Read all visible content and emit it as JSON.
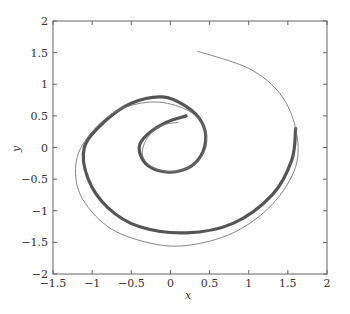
{
  "chart_data": {
    "type": "line",
    "title": "",
    "xlabel": "x",
    "ylabel": "y",
    "xlim": [
      -1.5,
      2
    ],
    "ylim": [
      -2,
      2
    ],
    "xticks": [
      "-1.5",
      "-1",
      "-0.5",
      "0",
      "0.5",
      "1",
      "1.5",
      "2"
    ],
    "yticks": [
      "2",
      "1.5",
      "1",
      "0.5",
      "0",
      "-0.5",
      "-1",
      "-1.5",
      "-2"
    ],
    "grid": false,
    "legend": null,
    "series": [
      {
        "name": "thick-spiral",
        "style": "thick dark gray markers",
        "color": "#555555",
        "points": [
          [
            0.2,
            0.5
          ],
          [
            -0.05,
            0.4
          ],
          [
            -0.3,
            0.2
          ],
          [
            -0.4,
            0
          ],
          [
            -0.32,
            -0.25
          ],
          [
            -0.1,
            -0.38
          ],
          [
            0.15,
            -0.36
          ],
          [
            0.35,
            -0.2
          ],
          [
            0.45,
            0.1
          ],
          [
            0.4,
            0.4
          ],
          [
            0.2,
            0.65
          ],
          [
            -0.1,
            0.8
          ],
          [
            -0.5,
            0.7
          ],
          [
            -0.85,
            0.4
          ],
          [
            -1.1,
            0
          ],
          [
            -1.05,
            -0.5
          ],
          [
            -0.8,
            -0.95
          ],
          [
            -0.4,
            -1.25
          ],
          [
            0.2,
            -1.35
          ],
          [
            0.8,
            -1.2
          ],
          [
            1.3,
            -0.75
          ],
          [
            1.55,
            -0.2
          ],
          [
            1.6,
            0.3
          ]
        ]
      },
      {
        "name": "thin-spiral",
        "style": "thin gray line",
        "color": "#777777",
        "points": [
          [
            0.1,
            0.4
          ],
          [
            -0.15,
            0.33
          ],
          [
            -0.32,
            0.1
          ],
          [
            -0.35,
            -0.15
          ],
          [
            -0.2,
            -0.33
          ],
          [
            0.05,
            -0.38
          ],
          [
            0.3,
            -0.27
          ],
          [
            0.45,
            0
          ],
          [
            0.42,
            0.35
          ],
          [
            0.2,
            0.6
          ],
          [
            -0.2,
            0.72
          ],
          [
            -0.65,
            0.6
          ],
          [
            -1.0,
            0.25
          ],
          [
            -1.2,
            -0.2
          ],
          [
            -1.15,
            -0.75
          ],
          [
            -0.8,
            -1.25
          ],
          [
            -0.3,
            -1.5
          ],
          [
            0.2,
            -1.55
          ],
          [
            0.8,
            -1.35
          ],
          [
            1.3,
            -0.9
          ],
          [
            1.6,
            -0.3
          ],
          [
            1.6,
            0.3
          ],
          [
            1.4,
            0.85
          ],
          [
            1.0,
            1.25
          ],
          [
            0.35,
            1.52
          ]
        ]
      }
    ]
  },
  "axes": {
    "x_label": "x",
    "y_label": "y"
  }
}
